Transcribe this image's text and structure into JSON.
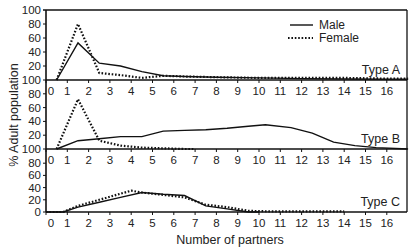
{
  "chart_data": {
    "type": "line",
    "title": "",
    "xlabel": "Number of partners",
    "ylabel": "% Adult population",
    "xlim": [
      0,
      17
    ],
    "x_ticks": [
      0,
      1,
      2,
      3,
      4,
      5,
      6,
      7,
      8,
      9,
      10,
      11,
      12,
      13,
      14,
      15,
      16
    ],
    "legend": {
      "position": "top-right of Type A panel",
      "entries": [
        {
          "name": "Male",
          "style": "solid"
        },
        {
          "name": "Female",
          "style": "dotted"
        }
      ]
    },
    "grid": false,
    "panels": [
      {
        "label": "Type A",
        "ylim": [
          0,
          100
        ],
        "y_ticks": [
          0,
          20,
          40,
          60,
          80,
          100
        ],
        "y_tick_labels": [
          "100",
          "20",
          "40",
          "60",
          "80",
          "100"
        ],
        "series": [
          {
            "name": "Male",
            "style": "solid",
            "x": [
              0.5,
              1.5,
              2.5,
              3.5,
              4.5,
              5.5,
              6.5,
              8,
              10,
              12,
              14,
              16,
              17
            ],
            "values": [
              0,
              53,
              24,
              20,
              12,
              6,
              5,
              4,
              3,
              2,
              1.5,
              1,
              1
            ]
          },
          {
            "name": "Female",
            "style": "dotted",
            "x": [
              0.5,
              1.5,
              2.5,
              3.5,
              4.5,
              5.5,
              6.5,
              8,
              10,
              12,
              14,
              16,
              17
            ],
            "values": [
              0,
              80,
              10,
              7,
              3,
              6,
              5,
              4,
              3,
              3,
              3,
              2,
              2
            ]
          }
        ]
      },
      {
        "label": "Type B",
        "ylim": [
          0,
          100
        ],
        "y_ticks": [
          0,
          20,
          40,
          60,
          80
        ],
        "y_tick_labels": [
          "100",
          "20",
          "40",
          "60",
          "80"
        ],
        "series": [
          {
            "name": "Male",
            "style": "solid",
            "x": [
              0.5,
              1.5,
              2.5,
              3.5,
              4.5,
              5.5,
              6.5,
              7.5,
              8.5,
              9.5,
              10.3,
              11.5,
              12.5,
              13.5,
              14.5,
              15.5,
              17
            ],
            "values": [
              0,
              12,
              15,
              18,
              18,
              26,
              27,
              28,
              30,
              33,
              35,
              31,
              23,
              10,
              5,
              2,
              0
            ]
          },
          {
            "name": "Female",
            "style": "dotted",
            "x": [
              0.5,
              1.5,
              2.5,
              3.5,
              4.5,
              5.5,
              6.5,
              7
            ],
            "values": [
              0,
              72,
              12,
              5,
              2,
              1,
              0,
              0
            ]
          }
        ]
      },
      {
        "label": "Type C",
        "ylim": [
          0,
          100
        ],
        "y_ticks": [
          0,
          20,
          40,
          60,
          80
        ],
        "y_tick_labels": [
          "0",
          "20",
          "40",
          "60",
          "80"
        ],
        "series": [
          {
            "name": "Male",
            "style": "solid",
            "x": [
              0,
              0.8,
              1.5,
              2.5,
              3.5,
              4.5,
              5.5,
              6.5,
              7.5,
              8.5,
              9.5,
              10
            ],
            "values": [
              0,
              0,
              8,
              16,
              24,
              32,
              29,
              27,
              10,
              5,
              0,
              0
            ]
          },
          {
            "name": "Female",
            "style": "dotted",
            "x": [
              0,
              0.8,
              1.5,
              2.5,
              3.5,
              4,
              4.5,
              5.5,
              6.5,
              7.5,
              8.5,
              9.5,
              10.5,
              12,
              14
            ],
            "values": [
              0,
              0,
              10,
              20,
              30,
              35,
              32,
              28,
              24,
              12,
              8,
              2,
              1,
              1,
              1
            ]
          }
        ]
      }
    ]
  }
}
